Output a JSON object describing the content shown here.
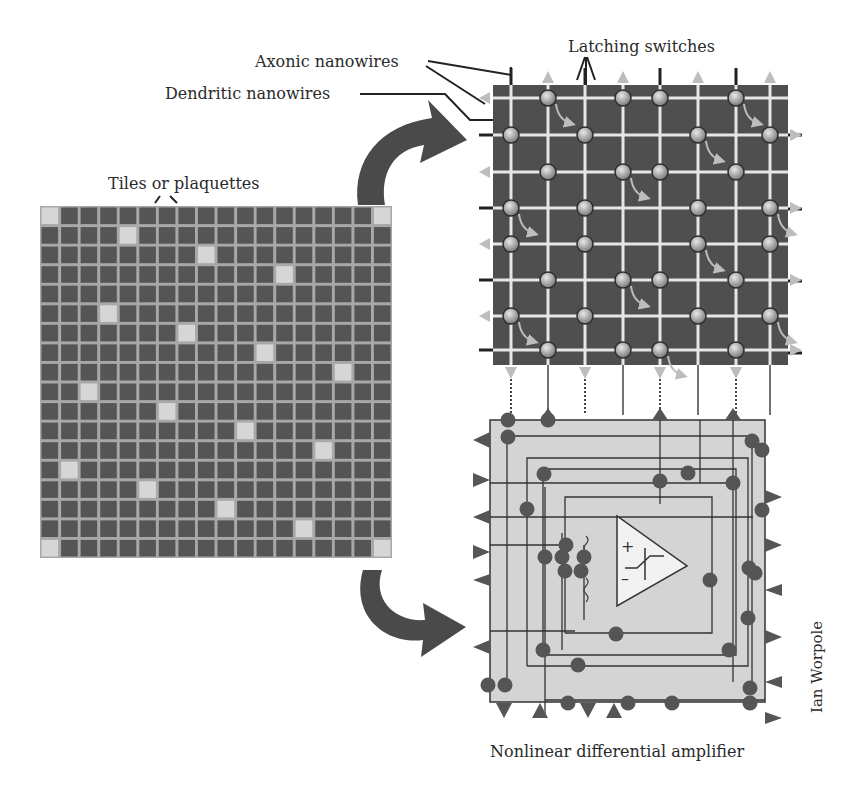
{
  "labels": {
    "axonic": "Axonic nanowires",
    "dendritic": "Dendritic nanowires",
    "latching": "Latching switches",
    "tiles": "Tiles or plaquettes",
    "amplifier": "Nonlinear differential amplifier",
    "credit": "Ian Worpole"
  },
  "colors": {
    "tile_dark": "#555555",
    "tile_light": "#d6d6d6",
    "tile_grid": "#a8a8a8",
    "crossbar_bg": "#4f4f4f",
    "crossbar_wire": "#e6e6e6",
    "switch_fill": "#9a9a9a",
    "arrow_light": "#bdbdbd",
    "circuit_bg": "#d4d4d4",
    "circuit_inner": "#dcdcdc",
    "circuit_line": "#333333",
    "circuit_node": "#555555",
    "big_arrow": "#4a4a4a",
    "text": "#2a2a2a"
  },
  "tile_grid": {
    "x": 40,
    "y": 206,
    "size": 352,
    "rows": 18,
    "cols": 18,
    "light_tiles": [
      [
        0,
        0
      ],
      [
        0,
        17
      ],
      [
        1,
        4
      ],
      [
        2,
        8
      ],
      [
        3,
        12
      ],
      [
        5,
        3
      ],
      [
        6,
        7
      ],
      [
        7,
        11
      ],
      [
        8,
        15
      ],
      [
        9,
        2
      ],
      [
        10,
        6
      ],
      [
        11,
        10
      ],
      [
        12,
        14
      ],
      [
        13,
        1
      ],
      [
        14,
        5
      ],
      [
        15,
        9
      ],
      [
        16,
        13
      ],
      [
        17,
        0
      ],
      [
        17,
        17
      ]
    ]
  },
  "crossbar": {
    "x": 493,
    "y": 85,
    "w": 295,
    "h": 280,
    "vwires": [
      511,
      548,
      585,
      623,
      660,
      698,
      736,
      770
    ],
    "hwires": [
      98,
      135,
      172,
      208,
      244,
      280,
      316,
      350
    ],
    "switches": [
      [
        548,
        98
      ],
      [
        623,
        98
      ],
      [
        660,
        98
      ],
      [
        736,
        98
      ],
      [
        511,
        135
      ],
      [
        585,
        135
      ],
      [
        698,
        135
      ],
      [
        770,
        135
      ],
      [
        548,
        172
      ],
      [
        623,
        172
      ],
      [
        660,
        172
      ],
      [
        736,
        172
      ],
      [
        511,
        208
      ],
      [
        585,
        208
      ],
      [
        698,
        208
      ],
      [
        770,
        208
      ],
      [
        511,
        244
      ],
      [
        585,
        244
      ],
      [
        698,
        244
      ],
      [
        770,
        244
      ],
      [
        548,
        280
      ],
      [
        623,
        280
      ],
      [
        660,
        280
      ],
      [
        736,
        280
      ],
      [
        511,
        316
      ],
      [
        585,
        316
      ],
      [
        698,
        316
      ],
      [
        770,
        316
      ],
      [
        548,
        350
      ],
      [
        623,
        350
      ],
      [
        660,
        350
      ],
      [
        736,
        350
      ]
    ]
  },
  "circuit": {
    "x": 490,
    "y": 420,
    "w": 275,
    "h": 282
  }
}
